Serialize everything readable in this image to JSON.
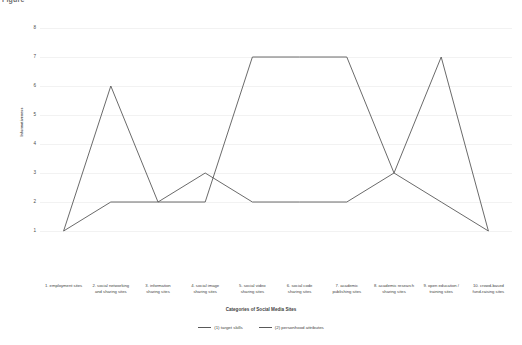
{
  "chart_data": {
    "type": "line",
    "title": "Figure",
    "xlabel": "Categories of Social Media Sites",
    "ylabel": "Informativeness",
    "ylim": [
      0,
      8
    ],
    "yticks": [
      1,
      2,
      3,
      4,
      5,
      6,
      7,
      8
    ],
    "grid": true,
    "legend_position": "bottom",
    "categories": [
      "1. employment sites",
      "2. social networking and sharing sites",
      "3. information sharing sites",
      "4. social image sharing sites",
      "5. social video sharing sites",
      "6. social code sharing sites",
      "7. academic publishing sites",
      "8. academic research sharing sites",
      "9. open education / training sites",
      "10. crowd-based fund-raising sites"
    ],
    "category_lines": [
      [
        "1. employment sites"
      ],
      [
        "2. social networking",
        "and sharing sites"
      ],
      [
        "3. information",
        "sharing sites"
      ],
      [
        "4. social image",
        "sharing sites"
      ],
      [
        "5. social video",
        "sharing sites"
      ],
      [
        "6. social code",
        "sharing sites"
      ],
      [
        "7. academic",
        "publishing sites"
      ],
      [
        "8. academic research",
        "sharing sites"
      ],
      [
        "9. open education /",
        "training sites"
      ],
      [
        "10. crowd-based",
        "fund-raising sites"
      ]
    ],
    "series": [
      {
        "name": "(1) target skills",
        "color": "#595959",
        "values": [
          1,
          6,
          2,
          3,
          2,
          2,
          2,
          3,
          7,
          1
        ]
      },
      {
        "name": "(2) personhood attributes",
        "color": "#595959",
        "values": [
          1,
          2,
          2,
          2,
          7,
          7,
          7,
          3,
          2,
          1
        ]
      }
    ]
  },
  "axis": {
    "y_title": "Informativeness",
    "x_title": "Categories of Social Media Sites"
  }
}
